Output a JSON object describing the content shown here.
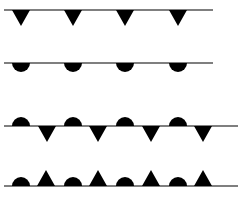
{
  "diagram": {
    "line_color": "#555555",
    "symbol_color": "#000000",
    "rows": [
      {
        "name": "cold-front",
        "y": 10,
        "x1": 4,
        "x2": 213,
        "symbols": [
          {
            "type": "triangle",
            "side": "below",
            "x": 21
          },
          {
            "type": "triangle",
            "side": "below",
            "x": 73
          },
          {
            "type": "triangle",
            "side": "below",
            "x": 125
          },
          {
            "type": "triangle",
            "side": "below",
            "x": 178
          }
        ]
      },
      {
        "name": "warm-front",
        "y": 63,
        "x1": 4,
        "x2": 213,
        "symbols": [
          {
            "type": "semicircle",
            "side": "below",
            "x": 21
          },
          {
            "type": "semicircle",
            "side": "below",
            "x": 73
          },
          {
            "type": "semicircle",
            "side": "below",
            "x": 125
          },
          {
            "type": "semicircle",
            "side": "below",
            "x": 178
          }
        ]
      },
      {
        "name": "stationary-front",
        "y": 126,
        "x1": 4,
        "x2": 238,
        "symbols": [
          {
            "type": "semicircle",
            "side": "above",
            "x": 21
          },
          {
            "type": "triangle",
            "side": "below",
            "x": 47
          },
          {
            "type": "semicircle",
            "side": "above",
            "x": 73
          },
          {
            "type": "triangle",
            "side": "below",
            "x": 98
          },
          {
            "type": "semicircle",
            "side": "above",
            "x": 125
          },
          {
            "type": "triangle",
            "side": "below",
            "x": 151
          },
          {
            "type": "semicircle",
            "side": "above",
            "x": 178
          },
          {
            "type": "triangle",
            "side": "below",
            "x": 203
          }
        ]
      },
      {
        "name": "occluded-front",
        "y": 186,
        "x1": 4,
        "x2": 238,
        "symbols": [
          {
            "type": "semicircle",
            "side": "above",
            "x": 21
          },
          {
            "type": "triangle",
            "side": "above",
            "x": 46
          },
          {
            "type": "semicircle",
            "side": "above",
            "x": 73
          },
          {
            "type": "triangle",
            "side": "above",
            "x": 98
          },
          {
            "type": "semicircle",
            "side": "above",
            "x": 125
          },
          {
            "type": "triangle",
            "side": "above",
            "x": 151
          },
          {
            "type": "semicircle",
            "side": "above",
            "x": 178
          },
          {
            "type": "triangle",
            "side": "above",
            "x": 203
          }
        ]
      }
    ]
  }
}
